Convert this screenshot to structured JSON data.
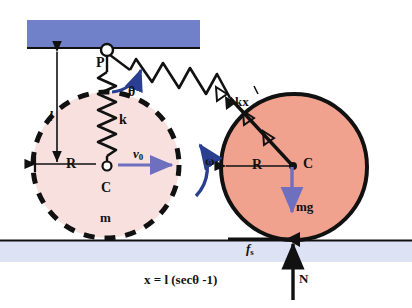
{
  "figure": {
    "type": "physics-free-body-diagram",
    "colors": {
      "ceiling": "#7181c9",
      "ground": "#dde2f5",
      "disc_solid": "#f0a28e",
      "disc_ghost": "#f7e0dd",
      "outline": "#111111",
      "force_arrow": "#6f6fc0",
      "angle_arc": "#2b3f91"
    }
  },
  "labels": {
    "pivot": "P",
    "spring_constant": "k",
    "length": "l",
    "angle": "θ",
    "spring_force": "kx",
    "spring_force_prime": "′",
    "radius_left": "R",
    "radius_right": "R",
    "center_left": "C",
    "center_right": "C",
    "mass": "m",
    "velocity": "v",
    "velocity_sub": "0",
    "angular_velocity": "ω",
    "angular_velocity_sub": "0",
    "weight": "mg",
    "friction": "f",
    "friction_sub": "s",
    "normal": "N"
  },
  "equation": {
    "text": "x = l (secθ -1)",
    "lhs": "x",
    "rhs": "l (secθ -1)"
  },
  "geometry": {
    "ceiling": {
      "x": 27,
      "y": 20,
      "width": 173,
      "height": 27
    },
    "ceiling_line_y": 48,
    "ground": {
      "x": 0,
      "y": 240,
      "width": 412,
      "height": 22
    },
    "ground_line_y": 240,
    "pivot_point": {
      "x": 107,
      "y": 52
    },
    "ghost_disc": {
      "cx": 106,
      "cy": 165,
      "r": 73
    },
    "solid_disc": {
      "cx": 294,
      "cy": 167,
      "r": 73
    }
  }
}
